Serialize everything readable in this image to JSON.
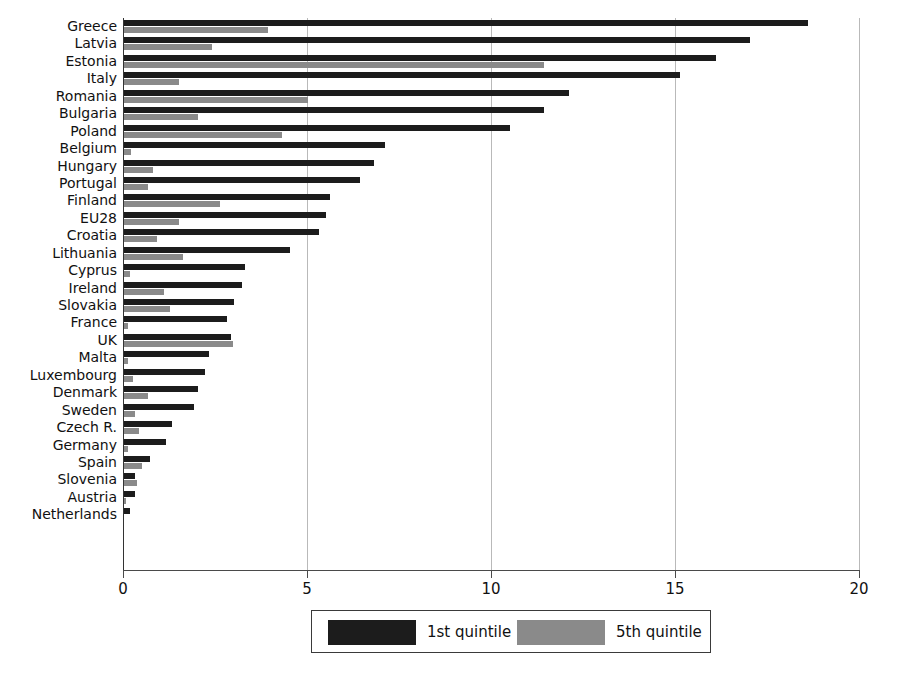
{
  "chart_data": {
    "type": "bar",
    "orientation": "horizontal",
    "title": "",
    "subtitle": "",
    "xlabel": "",
    "ylabel": "",
    "xlim": [
      0,
      20
    ],
    "ylim": null,
    "grid": true,
    "gridlines_axis": "x",
    "legend_position": "bottom-center",
    "xticks": [
      0,
      5,
      10,
      15,
      20
    ],
    "xticklabels": [
      "0",
      "5",
      "10",
      "15",
      "20"
    ],
    "categories": [
      "Greece",
      "Latvia",
      "Estonia",
      "Italy",
      "Romania",
      "Bulgaria",
      "Poland",
      "Belgium",
      "Hungary",
      "Portugal",
      "Finland",
      "EU28",
      "Croatia",
      "Lithuania",
      "Cyprus",
      "Ireland",
      "Slovakia",
      "France",
      "UK",
      "Malta",
      "Luxembourg",
      "Denmark",
      "Sweden",
      "Czech R.",
      "Germany",
      "Spain",
      "Slovenia",
      "Austria",
      "Netherlands"
    ],
    "series": [
      {
        "name": "1st quintile",
        "color": "#1c1c1c",
        "values": [
          18.6,
          17.0,
          16.1,
          15.1,
          12.1,
          11.4,
          10.5,
          7.1,
          6.8,
          6.4,
          5.6,
          5.5,
          5.3,
          4.5,
          3.3,
          3.2,
          3.0,
          2.8,
          2.9,
          2.3,
          2.2,
          2.0,
          1.9,
          1.3,
          1.15,
          0.7,
          0.3,
          0.3,
          0.15
        ]
      },
      {
        "name": "5th quintile",
        "color": "#8a8a8a",
        "values": [
          3.9,
          2.4,
          11.4,
          1.5,
          5.0,
          2.0,
          4.3,
          0.2,
          0.8,
          0.65,
          2.6,
          1.5,
          0.9,
          1.6,
          0.15,
          1.1,
          1.25,
          0.1,
          2.95,
          0.1,
          0.25,
          0.65,
          0.3,
          0.4,
          0.1,
          0.5,
          0.35,
          0.05,
          0.0
        ]
      }
    ]
  },
  "legend": {
    "entries": [
      {
        "label": "1st quintile",
        "color": "#1c1c1c"
      },
      {
        "label": "5th quintile",
        "color": "#8a8a8a"
      }
    ]
  },
  "colors": {
    "first_quintile": "#1c1c1c",
    "fifth_quintile": "#8a8a8a",
    "axis": "#333333",
    "grid": "#b9b9b9",
    "background": "#ffffff"
  }
}
